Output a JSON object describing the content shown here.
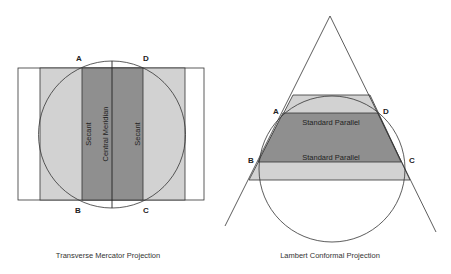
{
  "colors": {
    "dark_fill": "#8f8f8f",
    "light_fill": "#d2d2d2",
    "line": "#333333",
    "background": "#ffffff"
  },
  "left_figure": {
    "caption": "Transverse Mercator Projection",
    "labels": {
      "A": "A",
      "B": "B",
      "C": "C",
      "D": "D"
    },
    "zone_labels": {
      "secant_left": "Secant",
      "central_meridian": "Central Meridian",
      "secant_right": "Secant"
    }
  },
  "right_figure": {
    "caption": "Lambert Conformal Projection",
    "labels": {
      "A": "A",
      "B": "B",
      "C": "C",
      "D": "D"
    },
    "parallel_labels": {
      "upper": "Standard Parallel",
      "lower": "Standard Parallel"
    }
  }
}
